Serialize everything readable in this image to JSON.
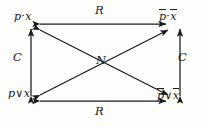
{
  "figure": {
    "type": "logic-square-diagram",
    "stroke_color": "#1a1a1a",
    "background_color": "#fdfdfb",
    "nodes": [
      {
        "id": "top-left",
        "text_plain": "p · x",
        "base": "p",
        "op": "·",
        "arg": "x",
        "bar_base": false,
        "bar_arg": false
      },
      {
        "id": "top-right",
        "text_plain": "p̄ · x̄",
        "base": "p",
        "op": "·",
        "arg": "x",
        "bar_base": true,
        "bar_arg": true
      },
      {
        "id": "bottom-left",
        "text_plain": "p∨x",
        "base": "p",
        "op": "∨",
        "arg": "x",
        "bar_base": false,
        "bar_arg": false
      },
      {
        "id": "bottom-right",
        "text_plain": "p̄∨x̄",
        "base": "p",
        "op": "∨",
        "arg": "x",
        "bar_base": true,
        "bar_arg": true
      }
    ],
    "edges": [
      {
        "id": "top",
        "label": "R",
        "from": "top-left",
        "to": "top-right",
        "style": "double-arrow",
        "orientation": "horizontal"
      },
      {
        "id": "bottom",
        "label": "R",
        "from": "bottom-left",
        "to": "bottom-right",
        "style": "double-arrow",
        "orientation": "horizontal"
      },
      {
        "id": "left",
        "label": "C",
        "from": "bottom-left",
        "to": "top-left",
        "style": "double-arrow",
        "orientation": "vertical"
      },
      {
        "id": "right",
        "label": "C",
        "from": "bottom-right",
        "to": "top-right",
        "style": "double-arrow",
        "orientation": "vertical"
      },
      {
        "id": "diag-1",
        "label": "N",
        "from": "bottom-left",
        "to": "top-right",
        "style": "double-arrow",
        "orientation": "diagonal"
      },
      {
        "id": "diag-2",
        "label": "N",
        "from": "top-left",
        "to": "bottom-right",
        "style": "double-arrow",
        "orientation": "diagonal"
      }
    ],
    "center_label": "N"
  }
}
